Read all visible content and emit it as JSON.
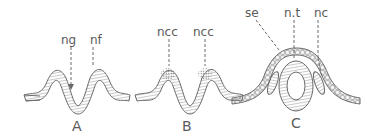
{
  "figure": {
    "stroke_color": "#6a6a6a",
    "panels": [
      {
        "id": "A",
        "label": "A",
        "annotations": [
          {
            "text": "ng"
          },
          {
            "text": "nf"
          }
        ]
      },
      {
        "id": "B",
        "label": "B",
        "annotations": [
          {
            "text": "ncc"
          },
          {
            "text": "ncc"
          }
        ]
      },
      {
        "id": "C",
        "label": "C",
        "annotations": [
          {
            "text": "se"
          },
          {
            "text": "n.t"
          },
          {
            "text": "nc"
          }
        ]
      }
    ]
  }
}
